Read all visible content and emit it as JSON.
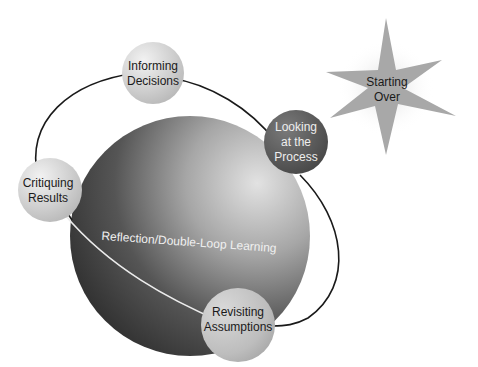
{
  "diagram": {
    "title": "Reflection/Double-Loop Learning",
    "center_label": "Reflection/Double-Loop Learning",
    "nodes": [
      {
        "id": "informing-decisions",
        "label": "Informing\nDecisions",
        "shade": "light-gray"
      },
      {
        "id": "looking-at-process",
        "label": "Looking\nat the\nProcess",
        "shade": "dark-gray"
      },
      {
        "id": "critiquing-results",
        "label": "Critiquing\nResults",
        "shade": "light-gray"
      },
      {
        "id": "revisiting-assumptions",
        "label": "Revisiting\nAssumptions",
        "shade": "light-gray"
      }
    ],
    "callout": {
      "id": "starting-over",
      "label": "Starting\nOver",
      "shape": "star"
    },
    "cycle_order": [
      "Informing Decisions",
      "Looking at the Process",
      "Revisiting Assumptions",
      "Critiquing Results"
    ],
    "colors": {
      "sphere_dark": "#3c3c3c",
      "sphere_light": "#bdbdbd",
      "orbit_line": "#1a1a1a",
      "orbit_front": "#e8e8e8",
      "star_fill": "#a9a9a9",
      "node_light": "#d4d4d4",
      "node_dark": "#595959"
    }
  }
}
